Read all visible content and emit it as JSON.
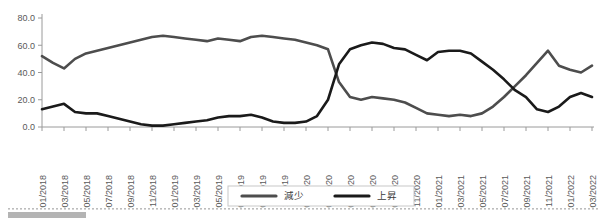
{
  "chart_data": {
    "type": "line",
    "title": "",
    "subtitle": "",
    "xlabel": "",
    "ylabel": "",
    "ylim": [
      0,
      80
    ],
    "yticks": [
      "0.0",
      "20.0",
      "40.0",
      "60.0",
      "80.0"
    ],
    "ytick_values": [
      0,
      20,
      40,
      60,
      80
    ],
    "grid": false,
    "legend_position": "bottom-center",
    "categories": [
      "01/2018",
      "02/2018",
      "03/2018",
      "04/2018",
      "05/2018",
      "06/2018",
      "07/2018",
      "08/2018",
      "09/2018",
      "10/2018",
      "11/2018",
      "12/2018",
      "01/2019",
      "02/2019",
      "03/2019",
      "04/2019",
      "05/2019",
      "06/2019",
      "07/2019",
      "08/2019",
      "09/2019",
      "10/2019",
      "11/2019",
      "12/2019",
      "01/2020",
      "02/2020",
      "03/2020",
      "04/2020",
      "05/2020",
      "06/2020",
      "07/2020",
      "08/2020",
      "09/2020",
      "10/2020",
      "11/2020",
      "12/2020",
      "01/2021",
      "02/2021",
      "03/2021",
      "04/2021",
      "05/2021",
      "06/2021",
      "07/2021",
      "08/2021",
      "09/2021",
      "10/2021",
      "11/2021",
      "12/2021",
      "01/2022",
      "02/2022",
      "03/2022"
    ],
    "xtick_labels": [
      "01/2018",
      "03/2018",
      "05/2018",
      "07/2018",
      "09/2018",
      "11/2018",
      "01/2019",
      "03/2019",
      "05/2019",
      "07/2019",
      "09/2019",
      "11/2019",
      "01/2020",
      "03/2020",
      "05/2020",
      "07/2020",
      "09/2020",
      "11/2020",
      "01/2021",
      "03/2021",
      "05/2021",
      "07/2021",
      "09/2021",
      "11/2021",
      "01/2022",
      "03/2022"
    ],
    "series": [
      {
        "name": "減少",
        "color": "#4d4d4d",
        "values": [
          52,
          47,
          43,
          50,
          54,
          56,
          58,
          60,
          62,
          64,
          66,
          67,
          66,
          65,
          64,
          63,
          65,
          64,
          63,
          66,
          67,
          66,
          65,
          64,
          62,
          60,
          57,
          33,
          22,
          20,
          22,
          21,
          20,
          18,
          14,
          10,
          9,
          8,
          9,
          8,
          10,
          15,
          22,
          30,
          38,
          47,
          56,
          45,
          42,
          40,
          45
        ]
      },
      {
        "name": "上昇",
        "color": "#1a1a1a",
        "values": [
          13,
          15,
          17,
          11,
          10,
          10,
          8,
          6,
          4,
          2,
          1,
          1,
          2,
          3,
          4,
          5,
          7,
          8,
          8,
          9,
          7,
          4,
          3,
          3,
          4,
          8,
          20,
          46,
          57,
          60,
          62,
          61,
          58,
          57,
          53,
          49,
          55,
          56,
          56,
          54,
          48,
          42,
          35,
          27,
          22,
          13,
          11,
          15,
          22,
          25,
          22
        ]
      }
    ]
  },
  "legend": {
    "items": [
      {
        "label": "減少"
      },
      {
        "label": "上昇"
      }
    ]
  }
}
